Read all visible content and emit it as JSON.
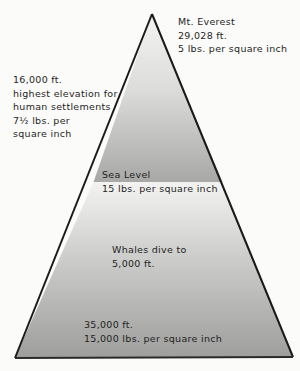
{
  "diagram": {
    "type": "pressure-pyramid",
    "colors": {
      "background": "#fbfbf9",
      "outline": "#1a1a1a",
      "above_sea_top": "#f0f0ee",
      "above_sea_bottom": "#a9a9a7",
      "below_sea_top": "#f2f2f0",
      "below_sea_bottom": "#9d9d9b"
    },
    "labels": {
      "everest": {
        "line1": "Mt. Everest",
        "line2": "29,028 ft.",
        "line3": "5 lbs. per square inch"
      },
      "settlements": {
        "line1": "16,000 ft.",
        "line2": "highest elevation for",
        "line3": "human settlements",
        "line4": "7½ lbs. per",
        "line5": "square inch"
      },
      "sea_level": {
        "line1": "Sea Level",
        "line2": "15 lbs. per square inch"
      },
      "whales": {
        "line1": "Whales dive to",
        "line2": "5,000 ft."
      },
      "deep": {
        "line1": "35,000 ft.",
        "line2": "15,000 lbs. per square inch"
      }
    }
  }
}
